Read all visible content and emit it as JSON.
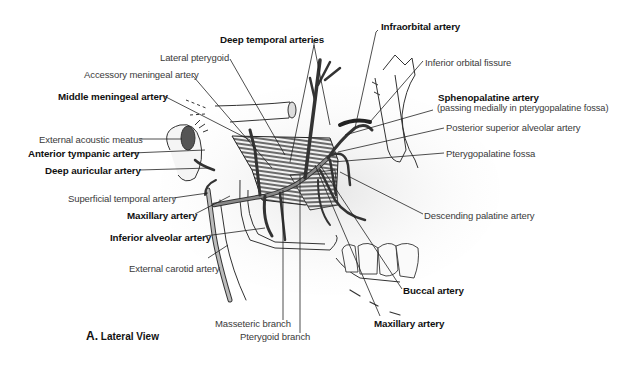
{
  "figure": {
    "caption_letter": "A.",
    "caption_text": "Lateral View"
  },
  "labels": {
    "deep_temporal_arteries": "Deep temporal arteries",
    "lateral_pterygoid": "Lateral pterygoid",
    "accessory_meningeal_artery": "Accessory meningeal artery",
    "middle_meningeal_artery": "Middle meningeal artery",
    "external_acoustic_meatus": "External acoustic meatus",
    "anterior_tympanic_artery": "Anterior tympanic artery",
    "deep_auricular_artery": "Deep auricular artery",
    "superficial_temporal_artery": "Superficial temporal artery",
    "maxillary_artery_left": "Maxillary artery",
    "inferior_alveolar_artery": "Inferior alveolar artery",
    "external_carotid_artery": "External carotid artery",
    "masseteric_branch": "Masseteric branch",
    "pterygoid_branch": "Pterygoid branch",
    "infraorbital_artery": "Infraorbital artery",
    "inferior_orbital_fissure": "Inferior orbital fissure",
    "sphenopalatine_artery": "Sphenopalatine artery",
    "sphenopalatine_note": "(passing medially in pterygopalatine fossa)",
    "posterior_superior_alveolar_artery": "Posterior superior alveolar artery",
    "pterygopalatine_fossa": "Pterygopalatine fossa",
    "descending_palatine_artery": "Descending palatine artery",
    "buccal_artery": "Buccal artery",
    "maxillary_artery_bottom": "Maxillary artery"
  }
}
